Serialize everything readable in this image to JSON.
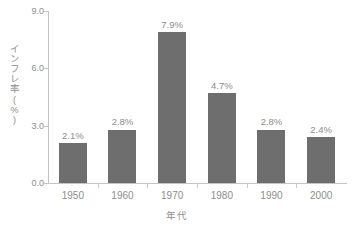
{
  "chart_data": {
    "type": "bar",
    "title": "",
    "subtitle": "",
    "xlabel": "年代",
    "ylabel": "インフレ率",
    "ylabel_unit": "(%)",
    "categories": [
      "1950",
      "1960",
      "1970",
      "1980",
      "1990",
      "2000"
    ],
    "values": [
      2.1,
      2.8,
      7.9,
      4.7,
      2.8,
      2.4
    ],
    "value_labels": [
      "2.1%",
      "2.8%",
      "7.9%",
      "4.7%",
      "2.8%",
      "2.4%"
    ],
    "ylim": [
      0.0,
      9.0
    ],
    "ytick_labels": [
      "0.0",
      "3.0",
      "6.0",
      "9.0"
    ],
    "ytick_values": [
      0.0,
      3.0,
      6.0,
      9.0
    ],
    "grid": false,
    "legend": false,
    "legend_position": "none",
    "colors": {
      "bar": "#6e6e6e",
      "axis": "#c4c4c4",
      "text": "#8d8d8d",
      "background": "#ffffff"
    }
  }
}
